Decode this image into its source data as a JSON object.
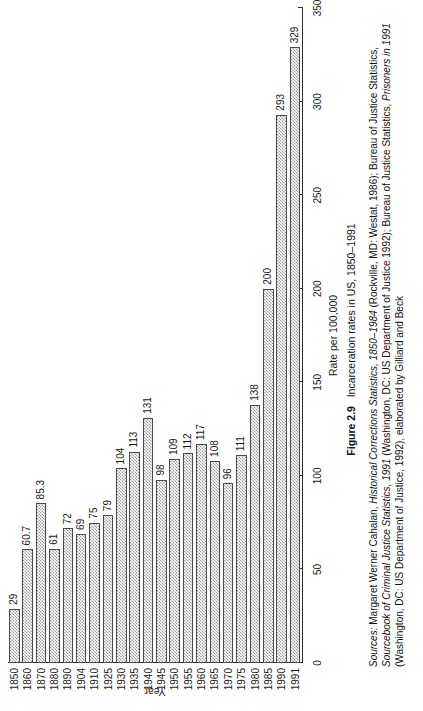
{
  "figure": {
    "number": "Figure 2.9",
    "title": "Incarceration rates in US, 1850–1991",
    "sources_lead": "Sources:",
    "sources_parts": [
      {
        "text": " Margaret Werner Cahalan, ",
        "italic": false
      },
      {
        "text": "Historical Corrections Statistics, 1850–1984",
        "italic": true
      },
      {
        "text": " (Rockville, MD: Westat, 1986); Bureau of Justice Statistics, ",
        "italic": false
      },
      {
        "text": "Sourcebook of Criminal Justice Statistics, 1991",
        "italic": true
      },
      {
        "text": " (Washington, DC: US Department of Justice 1992); Bureau of Justice Statistics, ",
        "italic": false
      },
      {
        "text": "Prisoners in 1991",
        "italic": true
      },
      {
        "text": " (Washington, DC: US Department of Justice, 1992), elaborated by Gilliard and Beck",
        "italic": false
      }
    ]
  },
  "chart_data": {
    "type": "bar",
    "orientation": "horizontal-on-rotated-page",
    "title": "Incarceration rates in US, 1850–1991",
    "xlabel": "Year",
    "ylabel": "Rate per 100,000",
    "ylim": [
      0,
      350
    ],
    "yticks": [
      0,
      50,
      100,
      150,
      200,
      250,
      300,
      350
    ],
    "grid": false,
    "legend": "none",
    "categories": [
      "1850",
      "1860",
      "1870",
      "1880",
      "1890",
      "1904",
      "1910",
      "1925",
      "1930",
      "1935",
      "1940",
      "1945",
      "1950",
      "1955",
      "1960",
      "1965",
      "1970",
      "1975",
      "1980",
      "1985",
      "1990",
      "1991"
    ],
    "values": [
      29,
      60.7,
      85.3,
      61,
      72,
      69,
      75,
      79,
      104,
      113,
      131,
      98,
      109,
      112,
      117,
      108,
      96,
      111,
      138,
      200,
      293,
      329
    ],
    "value_labels": [
      "29",
      "60.7",
      "85.3",
      "61",
      "72",
      "69",
      "75",
      "79",
      "104",
      "113",
      "131",
      "98",
      "109",
      "112",
      "117",
      "108",
      "96",
      "111",
      "138",
      "200",
      "293",
      "329"
    ]
  }
}
